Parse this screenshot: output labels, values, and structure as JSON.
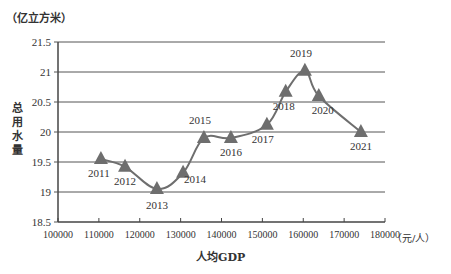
{
  "chart_data": {
    "type": "line",
    "title": "",
    "xlabel": "人均GDP",
    "ylabel": "总用水量",
    "x_unit": "（元/人）",
    "y_unit": "（亿立方米）",
    "xlim": [
      100000,
      180000
    ],
    "ylim": [
      18.5,
      21.5
    ],
    "x_ticks": [
      "100000",
      "110000",
      "120000",
      "130000",
      "140000",
      "150000",
      "160000",
      "170000",
      "180000"
    ],
    "y_ticks": [
      "18.5",
      "19",
      "19.5",
      "20",
      "20.5",
      "21",
      "21.5"
    ],
    "grid": "horizontal",
    "legend": "none",
    "marker": "triangle",
    "series": [
      {
        "name": "总用水量",
        "points": [
          {
            "label": "2011",
            "x": 110500,
            "y": 19.55
          },
          {
            "label": "2012",
            "x": 116400,
            "y": 19.42
          },
          {
            "label": "2013",
            "x": 124200,
            "y": 19.05
          },
          {
            "label": "2014",
            "x": 130600,
            "y": 19.32
          },
          {
            "label": "2015",
            "x": 135700,
            "y": 19.9
          },
          {
            "label": "2016",
            "x": 142300,
            "y": 19.9
          },
          {
            "label": "2017",
            "x": 151100,
            "y": 20.12
          },
          {
            "label": "2018",
            "x": 155700,
            "y": 20.67
          },
          {
            "label": "2019",
            "x": 160400,
            "y": 21.02
          },
          {
            "label": "2020",
            "x": 163800,
            "y": 20.6
          },
          {
            "label": "2021",
            "x": 174100,
            "y": 20.0
          }
        ]
      }
    ]
  },
  "colors": {
    "line": "#6e6e6e",
    "marker": "#6e6e6e",
    "grid": "#555555",
    "text": "#333333"
  },
  "label_offsets": {
    "2011": [
      -2,
      18
    ],
    "2012": [
      0,
      18
    ],
    "2013": [
      0,
      20
    ],
    "2014": [
      12,
      10
    ],
    "2015": [
      -4,
      -14
    ],
    "2016": [
      0,
      18
    ],
    "2017": [
      -4,
      18
    ],
    "2018": [
      -2,
      18
    ],
    "2019": [
      -4,
      -14
    ],
    "2020": [
      4,
      18
    ],
    "2021": [
      0,
      18
    ]
  }
}
